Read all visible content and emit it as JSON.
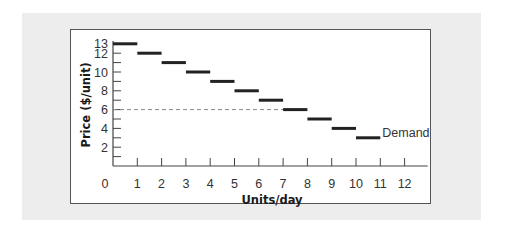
{
  "chart_data": {
    "type": "line",
    "subtype": "step-demand-schedule",
    "title": "",
    "xlabel": "Units/day",
    "ylabel": "Price ($/unit)",
    "xlim": [
      0,
      12
    ],
    "ylim": [
      0,
      13
    ],
    "x_ticks": [
      1,
      2,
      3,
      4,
      5,
      6,
      7,
      8,
      9,
      10,
      11,
      12
    ],
    "x_tick_labels": [
      "0",
      "1",
      "2",
      "3",
      "4",
      "5",
      "6",
      "7",
      "8",
      "9",
      "10",
      "11",
      "12"
    ],
    "y_ticks": [
      1,
      2,
      3,
      4,
      5,
      6,
      7,
      8,
      9,
      10,
      11,
      12,
      13
    ],
    "y_tick_labels": [
      "2",
      "4",
      "6",
      "8",
      "10",
      "12",
      "13"
    ],
    "grid": false,
    "legend": null,
    "series": [
      {
        "name": "Demand",
        "segments": [
          {
            "x_start": 0,
            "x_end": 1,
            "price": 13
          },
          {
            "x_start": 1,
            "x_end": 2,
            "price": 12
          },
          {
            "x_start": 2,
            "x_end": 3,
            "price": 11
          },
          {
            "x_start": 3,
            "x_end": 4,
            "price": 10
          },
          {
            "x_start": 4,
            "x_end": 5,
            "price": 9
          },
          {
            "x_start": 5,
            "x_end": 6,
            "price": 8
          },
          {
            "x_start": 6,
            "x_end": 7,
            "price": 7
          },
          {
            "x_start": 7,
            "x_end": 8,
            "price": 6
          },
          {
            "x_start": 8,
            "x_end": 9,
            "price": 5
          },
          {
            "x_start": 9,
            "x_end": 10,
            "price": 4
          },
          {
            "x_start": 10,
            "x_end": 11,
            "price": 3
          }
        ]
      }
    ],
    "reference_lines": [
      {
        "type": "horizontal-dashed",
        "y": 6,
        "x_start": 0,
        "x_end": 7
      }
    ],
    "annotations": [
      {
        "text": "Demand",
        "x": 11,
        "y": 3
      }
    ]
  },
  "labels": {
    "x_axis_title": "Units/day",
    "y_axis_title": "Price ($/unit)",
    "demand": "Demand",
    "origin": "0"
  },
  "colors": {
    "background_panel": "#ededed",
    "frame": "#555555",
    "axis": "#444444",
    "segment": "#222222",
    "dashed_line": "#888888",
    "text": "#333333"
  }
}
